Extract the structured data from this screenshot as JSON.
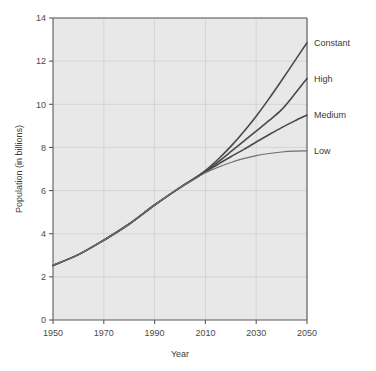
{
  "chart_data": {
    "type": "line",
    "title": "",
    "xlabel": "Year",
    "ylabel": "Population (in billions)",
    "xlim": [
      1950,
      2050
    ],
    "ylim": [
      0,
      14
    ],
    "xticks": [
      "1950",
      "1970",
      "1990",
      "2010",
      "2030",
      "2050"
    ],
    "xtick_values": [
      1950,
      1970,
      1990,
      2010,
      2030,
      2050
    ],
    "yticks": [
      "0",
      "2",
      "4",
      "6",
      "8",
      "10",
      "12",
      "14"
    ],
    "ytick_values": [
      0,
      2,
      4,
      6,
      8,
      10,
      12,
      14
    ],
    "grid": true,
    "legend_position": "right-inline-labels",
    "x": [
      1950,
      1960,
      1970,
      1980,
      1990,
      2000,
      2005,
      2010,
      2015,
      2020,
      2025,
      2030,
      2035,
      2040,
      2045,
      2050
    ],
    "series": [
      {
        "name": "Constant",
        "label": "Constant",
        "color": "#4a4a4a",
        "width": 1.6,
        "values": [
          2.53,
          3.03,
          3.7,
          4.45,
          5.33,
          6.14,
          6.52,
          6.93,
          7.45,
          8.05,
          8.72,
          9.45,
          10.25,
          11.1,
          11.98,
          12.85
        ]
      },
      {
        "name": "High",
        "label": "High",
        "color": "#4a4a4a",
        "width": 1.6,
        "values": [
          2.53,
          3.03,
          3.7,
          4.45,
          5.33,
          6.14,
          6.51,
          6.9,
          7.33,
          7.8,
          8.28,
          8.76,
          9.24,
          9.75,
          10.45,
          11.2
        ]
      },
      {
        "name": "Medium",
        "label": "Medium",
        "color": "#4a4a4a",
        "width": 1.6,
        "values": [
          2.53,
          3.03,
          3.7,
          4.45,
          5.33,
          6.14,
          6.5,
          6.87,
          7.22,
          7.57,
          7.9,
          8.25,
          8.59,
          8.92,
          9.22,
          9.5
        ]
      },
      {
        "name": "Low",
        "label": "Low",
        "color": "#6e6e6e",
        "width": 1.1,
        "values": [
          2.53,
          3.03,
          3.7,
          4.45,
          5.33,
          6.14,
          6.48,
          6.82,
          7.08,
          7.3,
          7.48,
          7.62,
          7.72,
          7.79,
          7.83,
          7.84
        ]
      }
    ],
    "colors": {
      "plot_background": "#e8e8e8",
      "page_background": "#ffffff",
      "grid": "#cfcfcf",
      "axis": "#5a5a5a",
      "text": "#3a3a3a"
    }
  }
}
